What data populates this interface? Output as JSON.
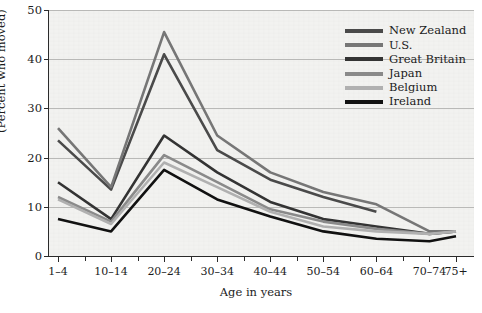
{
  "chart_data": {
    "type": "line",
    "title": "",
    "xlabel": "Age in years",
    "ylabel": "(Percent who moved)",
    "ylim": [
      0,
      50
    ],
    "yticks": [
      0,
      10,
      20,
      30,
      40,
      50
    ],
    "grid": true,
    "legend_position": "top-right",
    "categories": [
      "1–4",
      "5–9",
      "10–14",
      "15–19",
      "20–24",
      "25–29",
      "30–34",
      "35–39",
      "40–44",
      "45–49",
      "50–54",
      "55–59",
      "60–64",
      "65–69",
      "70–74",
      "75+"
    ],
    "tick_labels_shown": [
      "1–4",
      "10–14",
      "20–24",
      "30–34",
      "40–44",
      "50–54",
      "60–64",
      "70–74",
      "75+"
    ],
    "series": [
      {
        "name": "New Zealand",
        "color": "#4a4a4a",
        "values": [
          23.5,
          null,
          13.5,
          null,
          41.0,
          null,
          21.5,
          null,
          15.5,
          null,
          12.0,
          null,
          9.0,
          null,
          null,
          null
        ]
      },
      {
        "name": "U.S.",
        "color": "#767676",
        "values": [
          26.0,
          null,
          14.0,
          null,
          45.5,
          null,
          24.5,
          null,
          17.0,
          null,
          13.0,
          null,
          10.5,
          null,
          5.0,
          5.0
        ]
      },
      {
        "name": "Great Britain",
        "color": "#333333",
        "values": [
          15.0,
          null,
          7.5,
          null,
          24.5,
          null,
          17.0,
          null,
          11.0,
          null,
          7.5,
          null,
          6.0,
          null,
          4.5,
          5.0
        ]
      },
      {
        "name": "Japan",
        "color": "#8a8a8a",
        "values": [
          12.0,
          null,
          7.0,
          null,
          20.5,
          null,
          15.0,
          null,
          9.5,
          null,
          7.0,
          null,
          5.5,
          null,
          4.5,
          5.0
        ]
      },
      {
        "name": "Belgium",
        "color": "#b0b0b0",
        "values": [
          11.5,
          null,
          6.5,
          null,
          19.0,
          null,
          14.0,
          null,
          9.0,
          null,
          6.0,
          null,
          5.0,
          null,
          4.5,
          5.0
        ]
      },
      {
        "name": "Ireland",
        "color": "#111111",
        "values": [
          7.5,
          null,
          5.0,
          null,
          17.5,
          null,
          11.5,
          null,
          8.0,
          null,
          5.0,
          null,
          3.5,
          null,
          3.0,
          4.0
        ]
      }
    ]
  },
  "axis": {
    "y_title": "(Percent who moved)",
    "x_title": "Age in years"
  },
  "legend": {
    "items": [
      {
        "label": "New Zealand",
        "color": "#4a4a4a"
      },
      {
        "label": "U.S.",
        "color": "#767676"
      },
      {
        "label": "Great Britain",
        "color": "#333333"
      },
      {
        "label": "Japan",
        "color": "#8a8a8a"
      },
      {
        "label": "Belgium",
        "color": "#b0b0b0"
      },
      {
        "label": "Ireland",
        "color": "#111111"
      }
    ]
  }
}
